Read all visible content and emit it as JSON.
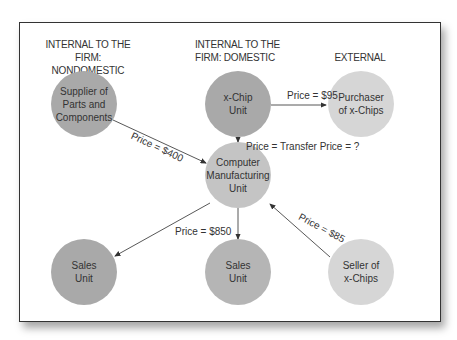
{
  "headers": {
    "nondomestic": "INTERNAL TO THE FIRM: NONDOMESTIC",
    "nondomestic_l1": "INTERNAL TO THE",
    "nondomestic_l2": "FIRM: NONDOMESTIC",
    "domestic_l1": "INTERNAL TO THE",
    "domestic_l2": "FIRM: DOMESTIC",
    "external": "EXTERNAL"
  },
  "nodes": {
    "supplier": {
      "l1": "Supplier of",
      "l2": "Parts and",
      "l3": "Components",
      "color": "#a9a9a9"
    },
    "xchip": {
      "l1": "x-Chip",
      "l2": "Unit",
      "color": "#a9a9a9"
    },
    "purchaser": {
      "l1": "Purchaser",
      "l2": "of x-Chips",
      "color": "#d6d6d6"
    },
    "computer": {
      "l1": "Computer",
      "l2": "Manufacturing",
      "l3": "Unit",
      "color": "#c4c4c4"
    },
    "sales_nondomestic": {
      "l1": "Sales",
      "l2": "Unit",
      "color": "#a9a9a9"
    },
    "sales_domestic": {
      "l1": "Sales",
      "l2": "Unit",
      "color": "#b5b5b5"
    },
    "seller": {
      "l1": "Seller of",
      "l2": "x-Chips",
      "color": "#d6d6d6"
    }
  },
  "edges": {
    "supplier_to_computer": "Price = $400",
    "xchip_to_purchaser": "Price = $95",
    "xchip_to_computer": "Price = Transfer Price = ?",
    "computer_to_sales": "Price = $850",
    "seller_to_computer": "Price = $85"
  }
}
